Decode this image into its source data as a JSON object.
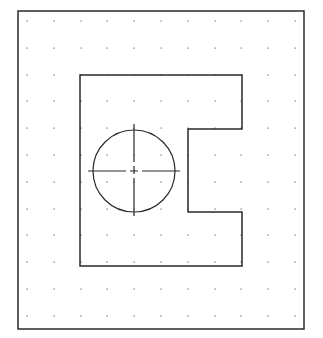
{
  "drawing": {
    "background": "#ffffff",
    "line_color": "#2a2a2a",
    "dot_color": "#6b6b6b",
    "border": {
      "x1": 18,
      "y1": 11,
      "x2": 304,
      "y2": 329
    },
    "grid": {
      "x": [
        27,
        53.8,
        80.6,
        107.4,
        134.2,
        161,
        187.8,
        214.6,
        241.4,
        268.2,
        295
      ],
      "y": [
        21,
        47.8,
        74.6,
        101.4,
        128.2,
        155,
        181.8,
        208.6,
        235.4,
        262.2,
        289,
        315.8
      ]
    },
    "part_outline": {
      "points": [
        [
          80,
          75
        ],
        [
          242,
          75
        ],
        [
          242,
          129
        ],
        [
          188,
          129
        ],
        [
          188,
          212
        ],
        [
          242,
          212
        ],
        [
          242,
          266
        ],
        [
          80,
          266
        ]
      ]
    },
    "hole": {
      "cx": 134,
      "cy": 171,
      "r": 41
    },
    "centerlines": {
      "horizontal": {
        "x1": 88,
        "x2": 180,
        "y": 171
      },
      "vertical": {
        "y1": 124,
        "y2": 218,
        "x": 134
      },
      "dasharray": "38 4 8 4"
    }
  }
}
